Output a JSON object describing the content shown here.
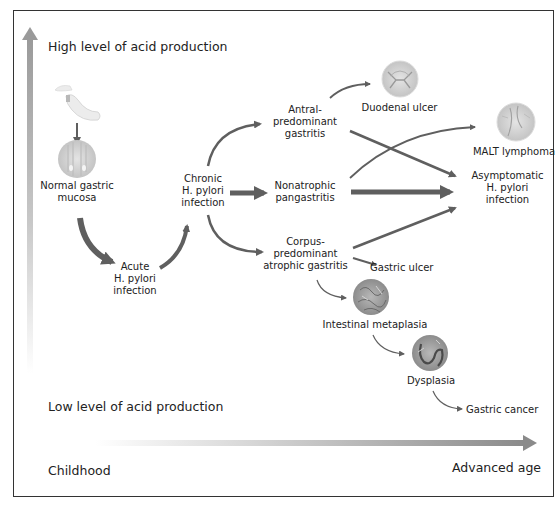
{
  "diagram": {
    "y_axis": {
      "top_label": "High level of acid production",
      "bottom_label": "Low level of acid production"
    },
    "x_axis": {
      "left_label": "Childhood",
      "right_label": "Advanced age"
    },
    "nodes": {
      "normal_mucosa": {
        "line1": "Normal gastric",
        "line2": "mucosa"
      },
      "acute": {
        "line1": "Acute",
        "line2": "H. pylori",
        "line3": "infection"
      },
      "chronic": {
        "line1": "Chronic",
        "line2": "H. pylori",
        "line3": "infection"
      },
      "antral": {
        "line1": "Antral-",
        "line2": "predominant",
        "line3": "gastritis"
      },
      "nonatrophic": {
        "line1": "Nonatrophic",
        "line2": "pangastritis"
      },
      "corpus": {
        "line1": "Corpus-",
        "line2": "predominant",
        "line3": "atrophic gastritis"
      },
      "duodenal_ulcer": {
        "label": "Duodenal ulcer"
      },
      "malt": {
        "label": "MALT lymphoma"
      },
      "asymptomatic": {
        "line1": "Asymptomatic",
        "line2": "H. pylori",
        "line3": "infection"
      },
      "gastric_ulcer": {
        "label": "Gastric ulcer"
      },
      "intestinal_metaplasia": {
        "label": "Intestinal metaplasia"
      },
      "dysplasia": {
        "label": "Dysplasia"
      },
      "gastric_cancer": {
        "label": "Gastric cancer"
      }
    },
    "edges": [
      {
        "from": "stomach",
        "to": "normal_mucosa"
      },
      {
        "from": "normal_mucosa",
        "to": "acute",
        "weight": "thick"
      },
      {
        "from": "acute",
        "to": "chronic",
        "weight": "medium"
      },
      {
        "from": "chronic",
        "to": "antral"
      },
      {
        "from": "chronic",
        "to": "nonatrophic",
        "weight": "thick"
      },
      {
        "from": "chronic",
        "to": "corpus"
      },
      {
        "from": "antral",
        "to": "duodenal_ulcer"
      },
      {
        "from": "antral",
        "to": "asymptomatic"
      },
      {
        "from": "nonatrophic",
        "to": "malt"
      },
      {
        "from": "nonatrophic",
        "to": "asymptomatic",
        "weight": "thick"
      },
      {
        "from": "corpus",
        "to": "asymptomatic"
      },
      {
        "from": "corpus",
        "to": "gastric_ulcer"
      },
      {
        "from": "corpus",
        "to": "intestinal_metaplasia"
      },
      {
        "from": "intestinal_metaplasia",
        "to": "dysplasia"
      },
      {
        "from": "dysplasia",
        "to": "gastric_cancer"
      }
    ],
    "colors": {
      "arrow": "#5f5f5f",
      "axis_dark": "#9a9a9a",
      "text": "#222222",
      "border": "#333333"
    }
  }
}
